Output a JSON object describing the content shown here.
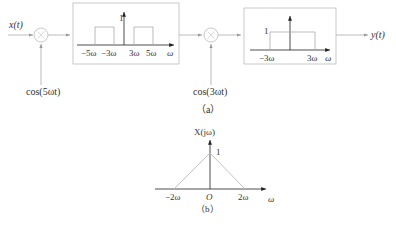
{
  "diagram": {
    "part_a": {
      "caption": "（a）",
      "input_label": "x(t)",
      "output_label": "y(t)",
      "multiplier1": {
        "symbol": "×",
        "carrier_label": "cos(5ωt)"
      },
      "multiplier2": {
        "symbol": "×",
        "carrier_label": "cos(3ωt)"
      },
      "filter1": {
        "type": "band-pass",
        "amplitude_label": "1",
        "tick_labels": [
          "−5ω",
          "−3ω",
          "3ω",
          "5ω"
        ],
        "axis_label": "ω"
      },
      "filter2": {
        "type": "low-pass",
        "amplitude_label": "1",
        "tick_labels": [
          "−3ω",
          "3ω"
        ],
        "axis_label": "ω"
      }
    },
    "part_b": {
      "caption": "（b）",
      "y_axis_label": "X(jω)",
      "peak_label": "1",
      "tick_labels": [
        "−2ω",
        "O",
        "2ω"
      ],
      "axis_label": "ω"
    }
  },
  "colors": {
    "line": "#999999",
    "axis": "#333333",
    "box_border": "#aaaaaa",
    "text": "#333333"
  }
}
